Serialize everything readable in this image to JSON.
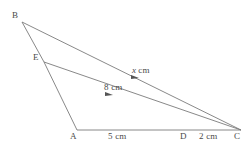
{
  "figure": {
    "type": "geometry-diagram",
    "background_color": "#ffffff",
    "stroke_color": "#7a7a7a",
    "text_color": "#4a4a4a",
    "canvas": {
      "width": 251,
      "height": 151
    },
    "vertices": [
      {
        "id": "B",
        "label": "B",
        "x": 22,
        "y": 22
      },
      {
        "id": "E",
        "label": "E",
        "x": 44,
        "y": 62
      },
      {
        "id": "A",
        "label": "A",
        "x": 77,
        "y": 130
      },
      {
        "id": "D",
        "label": "D",
        "x": 183,
        "y": 129
      },
      {
        "id": "C",
        "label": "C",
        "x": 241,
        "y": 130
      }
    ],
    "segments": [
      {
        "id": "BC",
        "from": "B",
        "to": "C",
        "marker": "arrow-mid"
      },
      {
        "id": "BE",
        "from": "B",
        "to": "E",
        "marker": "none"
      },
      {
        "id": "EA",
        "from": "E",
        "to": "A",
        "marker": "none"
      },
      {
        "id": "EC",
        "from": "E",
        "to": "C",
        "marker": "arrow-mid"
      },
      {
        "id": "AC",
        "from": "A",
        "to": "C",
        "marker": "none"
      }
    ],
    "measures": [
      {
        "id": "x",
        "segment": "BC",
        "value": "x",
        "unit": "cm",
        "italic_value": true,
        "text": "x cm"
      },
      {
        "id": "m8",
        "segment": "EC",
        "value": "8",
        "unit": "cm",
        "italic_value": false,
        "text": "8 cm"
      },
      {
        "id": "m5",
        "segment": "AD",
        "value": "5",
        "unit": "cm",
        "italic_value": false,
        "text": "5 cm"
      },
      {
        "id": "m2",
        "segment": "DC",
        "value": "2",
        "unit": "cm",
        "italic_value": false,
        "text": "2 cm"
      }
    ]
  }
}
